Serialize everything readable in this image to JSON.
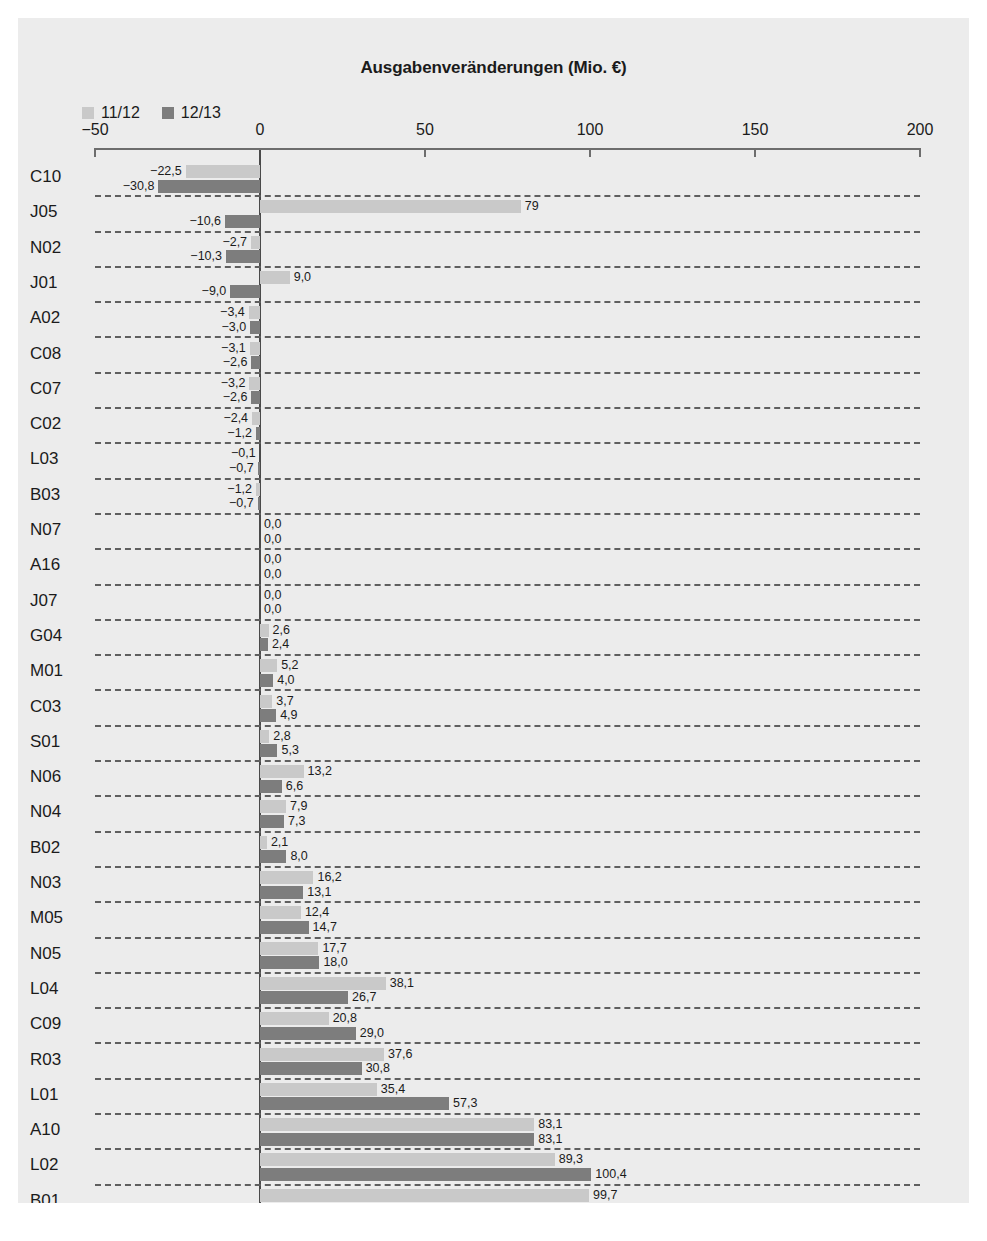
{
  "chart_data": {
    "type": "bar",
    "orientation": "horizontal",
    "title": "Ausgabenveränderungen (Mio. €)",
    "xlabel": "",
    "ylabel": "",
    "xlim": [
      -50,
      200
    ],
    "xticks": [
      -50,
      0,
      50,
      100,
      150,
      200
    ],
    "xtick_labels": [
      "−50",
      "0",
      "50",
      "100",
      "150",
      "200"
    ],
    "grid": "dashed-horizontal-row-separators",
    "legend_position": "top-left",
    "decimal_separator": ",",
    "categories": [
      "C10",
      "J05",
      "N02",
      "J01",
      "A02",
      "C08",
      "C07",
      "C02",
      "L03",
      "B03",
      "N07",
      "A16",
      "J07",
      "G04",
      "M01",
      "C03",
      "S01",
      "N06",
      "N04",
      "B02",
      "N03",
      "M05",
      "N05",
      "L04",
      "C09",
      "R03",
      "L01",
      "A10",
      "L02",
      "B01"
    ],
    "series": [
      {
        "name": "11/12",
        "color": "#c9c9c9",
        "values": [
          -22.5,
          79.0,
          -2.7,
          9.0,
          -3.4,
          -3.1,
          -3.2,
          -2.4,
          -0.1,
          -1.2,
          0.0,
          0.0,
          0.0,
          2.6,
          5.2,
          3.7,
          2.8,
          13.2,
          7.9,
          2.1,
          16.2,
          12.4,
          17.7,
          38.1,
          20.8,
          37.6,
          35.4,
          83.1,
          89.3,
          99.7
        ],
        "labels": [
          "−22,5",
          "79",
          "−2,7",
          "9,0",
          "−3,4",
          "−3,1",
          "−3,2",
          "−2,4",
          "−0,1",
          "−1,2",
          "0,0",
          "0,0",
          "0,0",
          "2,6",
          "5,2",
          "3,7",
          "2,8",
          "13,2",
          "7,9",
          "2,1",
          "16,2",
          "12,4",
          "17,7",
          "38,1",
          "20,8",
          "37,6",
          "35,4",
          "83,1",
          "89,3",
          "99,7"
        ]
      },
      {
        "name": "12/13",
        "color": "#7d7d7d",
        "values": [
          -30.8,
          -10.6,
          -10.3,
          -9.0,
          -3.0,
          -2.6,
          -2.6,
          -1.2,
          -0.7,
          -0.7,
          0.0,
          0.0,
          0.0,
          2.4,
          4.0,
          4.9,
          5.3,
          6.6,
          7.3,
          8.0,
          13.1,
          14.7,
          18.0,
          26.7,
          29.0,
          30.8,
          57.3,
          83.1,
          100.4,
          151.6
        ],
        "labels": [
          "−30,8",
          "−10,6",
          "−10,3",
          "−9,0",
          "−3,0",
          "−2,6",
          "−2,6",
          "−1,2",
          "−0,7",
          "−0,7",
          "0,0",
          "0,0",
          "0,0",
          "2,4",
          "4,0",
          "4,9",
          "5,3",
          "6,6",
          "7,3",
          "8,0",
          "13,1",
          "14,7",
          "18,0",
          "26,7",
          "29,0",
          "30,8",
          "57,3",
          "83,1",
          "100,4",
          "151,6"
        ]
      }
    ]
  },
  "colors": {
    "background": "#ececec",
    "series_11_12": "#c9c9c9",
    "series_12_13": "#7d7d7d",
    "axis": "#6d6d6d",
    "text": "#1b1b1b"
  }
}
